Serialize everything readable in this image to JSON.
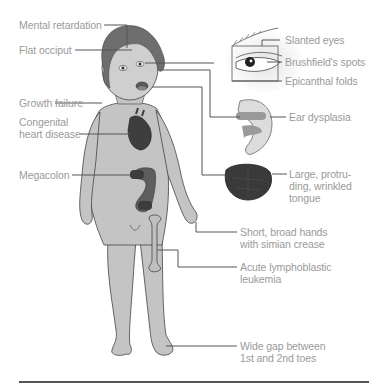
{
  "diagram": {
    "labels_left": [
      {
        "id": "mental",
        "text": "Mental retardation"
      },
      {
        "id": "occiput",
        "text": "Flat occiput"
      },
      {
        "id": "growth",
        "text": "Growth failure"
      },
      {
        "id": "heart_1",
        "text": "Congenital"
      },
      {
        "id": "heart_2",
        "text": "heart disease"
      },
      {
        "id": "megacolon",
        "text": "Megacolon"
      }
    ],
    "labels_right": [
      {
        "id": "slanted",
        "text": "Slanted eyes"
      },
      {
        "id": "brushfield",
        "text": "Brushfield's spots"
      },
      {
        "id": "epicanthal",
        "text": "Epicanthal folds"
      },
      {
        "id": "ear",
        "text": "Ear dysplasia"
      },
      {
        "id": "tongue_1",
        "text": "Large, protru-"
      },
      {
        "id": "tongue_2",
        "text": "ding, wrinkled"
      },
      {
        "id": "tongue_3",
        "text": "tongue"
      },
      {
        "id": "hands_1",
        "text": "Short, broad hands"
      },
      {
        "id": "hands_2",
        "text": "with simian crease"
      },
      {
        "id": "leuk_1",
        "text": "Acute lymphoblastic"
      },
      {
        "id": "leuk_2",
        "text": "leukemia"
      },
      {
        "id": "toes_1",
        "text": "Wide gap between"
      },
      {
        "id": "toes_2",
        "text": "1st and 2nd toes"
      }
    ],
    "colors": {
      "label_text": "#9a9a9a",
      "leader_line": "#555555",
      "skin": "#c4c4c4",
      "hair": "#6e6e6e",
      "organ": "#4a4a4a"
    }
  }
}
